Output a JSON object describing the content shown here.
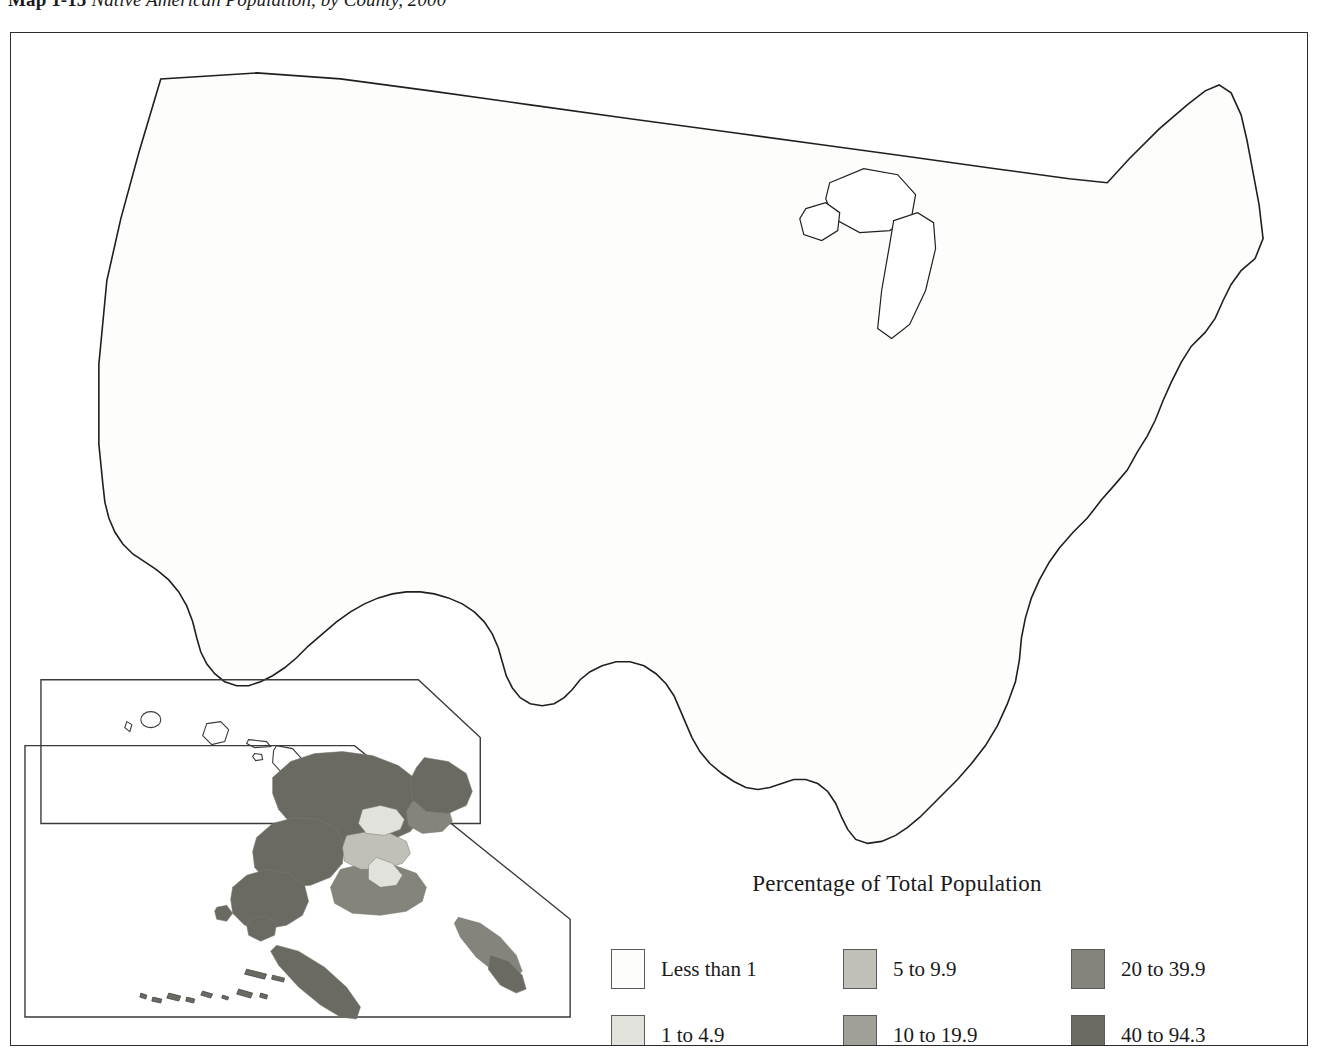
{
  "figure": {
    "number_label": "Map 1-15",
    "caption": "Native American Population, by County, 2000"
  },
  "legend": {
    "title": "Percentage of Total Population",
    "entries": [
      {
        "label": "Less than 1",
        "color": "#fdfdfb",
        "min": 0,
        "max": 1
      },
      {
        "label": "1 to 4.9",
        "color": "#e2e2dc",
        "min": 1,
        "max": 4.9
      },
      {
        "label": "5 to 9.9",
        "color": "#c0c0b9",
        "min": 5,
        "max": 9.9
      },
      {
        "label": "10 to 19.9",
        "color": "#a0a098",
        "min": 10,
        "max": 19.9
      },
      {
        "label": "20 to 39.9",
        "color": "#84847c",
        "min": 20,
        "max": 39.9
      },
      {
        "label": "40 to 94.3",
        "color": "#6a6a62",
        "min": 40,
        "max": 94.3
      }
    ],
    "column_order": [
      0,
      2,
      4,
      1,
      3,
      5
    ]
  },
  "chart_data": {
    "type": "map",
    "title": "Native American Population, by County, 2000",
    "geography": "United States counties, including Alaska and Hawaii insets",
    "units": "percent",
    "classes": [
      "Less than 1",
      "1 to 4.9",
      "5 to 9.9",
      "10 to 19.9",
      "20 to 39.9",
      "40 to 94.3"
    ],
    "class_colors": [
      "#fdfdfb",
      "#e2e2dc",
      "#c0c0b9",
      "#a0a098",
      "#84847c",
      "#6a6a62"
    ],
    "value_range": [
      0,
      94.3
    ],
    "insets": [
      "Alaska",
      "Hawaii"
    ],
    "notable_high_regions": [
      "Navajo Nation (Four Corners: AZ, NM, UT)",
      "Western and central South Dakota reservations",
      "Northern Arizona",
      "Eastern Oklahoma",
      "Northwestern Montana and northern North Dakota",
      "Most of Alaska outside the Anchorage corridor",
      "Robeson County, North Carolina",
      "Swain County, North Carolina"
    ],
    "notable_low_regions": [
      "Most of the Northeast and Mid-Atlantic",
      "Appalachia and the Deep South interior",
      "Midwest corn belt",
      "Central Texas"
    ]
  },
  "map_graphic": {
    "frame": {
      "x": 10,
      "y": 32,
      "width": 1298,
      "height": 1014
    },
    "alaska_inset_label": "alaska-inset",
    "hawaii_inset_label": "hawaii-inset"
  }
}
